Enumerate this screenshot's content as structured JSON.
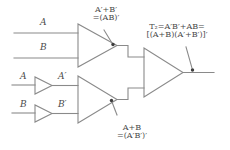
{
  "diagram": {
    "line_color": "#8a8a8a",
    "text_color": "#4a4a4a",
    "background": "#ffffff"
  },
  "inputs": {
    "top_a": "A",
    "top_b": "B",
    "bottom_a": "A",
    "bottom_b": "B"
  },
  "intermediate": {
    "inverter_a_out": "A′",
    "inverter_b_out": "B′"
  },
  "annotations": {
    "top_gate_line1": "A′+B′",
    "top_gate_line2": "=(AB)′",
    "bottom_gate_line1": "A+B",
    "bottom_gate_line2": "=(A′B′)′",
    "output_line1": "T₂=A′B′+AB=",
    "output_line2": "[(A+B)(A′+B′)]′"
  },
  "gates": {
    "top": "nand-gate",
    "inverter_top": "inverter-gate",
    "inverter_bottom": "inverter-gate",
    "middle": "nor-gate",
    "output": "nand-gate"
  }
}
